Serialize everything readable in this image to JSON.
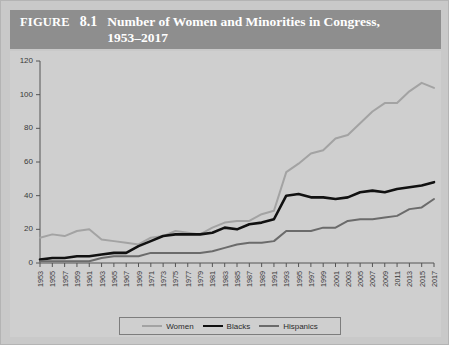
{
  "figure": {
    "label": "FIGURE",
    "number": "8.1",
    "title": "Number of Women and Minorities in Congress, 1953–2017",
    "banner_color": "#8e8e8e",
    "page_background": "#c9c9c9",
    "plot_background": "#cfcfcf"
  },
  "legend": {
    "position": "bottom-center",
    "items": [
      {
        "label": "Women",
        "color": "#a3a3a3",
        "width": 2.0
      },
      {
        "label": "Blacks",
        "color": "#111111",
        "width": 2.6
      },
      {
        "label": "Hispanics",
        "color": "#6b6b6b",
        "width": 2.0
      }
    ]
  },
  "chart_data": {
    "type": "line",
    "title": "Number of Women and Minorities in Congress, 1953–2017",
    "xlabel": "",
    "ylabel": "",
    "grid": false,
    "legend_position": "bottom-center",
    "xlim": [
      1953,
      2017
    ],
    "ylim": [
      0,
      120
    ],
    "ytick_values": [
      0,
      20,
      40,
      60,
      80,
      100,
      120
    ],
    "ytick_labels": [
      "0",
      "20",
      "40",
      "60",
      "80",
      "100",
      "120"
    ],
    "x": [
      1953,
      1955,
      1957,
      1959,
      1961,
      1963,
      1965,
      1967,
      1969,
      1971,
      1973,
      1975,
      1977,
      1979,
      1981,
      1983,
      1985,
      1987,
      1989,
      1991,
      1993,
      1995,
      1997,
      1999,
      2001,
      2003,
      2005,
      2007,
      2009,
      2011,
      2013,
      2015,
      2017
    ],
    "categories": [
      "1953",
      "1955",
      "1957",
      "1959",
      "1961",
      "1963",
      "1965",
      "1967",
      "1969",
      "1971",
      "1973",
      "1975",
      "1977",
      "1979",
      "1981",
      "1983",
      "1985",
      "1987",
      "1989",
      "1991",
      "1993",
      "1995",
      "1997",
      "1999",
      "2001",
      "2003",
      "2005",
      "2007",
      "2009",
      "2011",
      "2013",
      "2015",
      "2017"
    ],
    "series": [
      {
        "name": "Women",
        "color": "#a3a3a3",
        "values": [
          15,
          17,
          16,
          19,
          20,
          14,
          13,
          12,
          11,
          15,
          16,
          19,
          18,
          17,
          21,
          24,
          25,
          25,
          29,
          31,
          54,
          59,
          65,
          67,
          74,
          76,
          83,
          90,
          95,
          95,
          102,
          107,
          104
        ]
      },
      {
        "name": "Blacks",
        "color": "#111111",
        "values": [
          2,
          3,
          3,
          4,
          4,
          5,
          6,
          6,
          10,
          13,
          16,
          17,
          17,
          17,
          18,
          21,
          20,
          23,
          24,
          26,
          40,
          41,
          39,
          39,
          38,
          39,
          42,
          43,
          42,
          44,
          45,
          46,
          48
        ]
      },
      {
        "name": "Hispanics",
        "color": "#6b6b6b",
        "values": [
          1,
          1,
          1,
          1,
          1,
          3,
          4,
          4,
          4,
          6,
          6,
          6,
          6,
          6,
          7,
          9,
          11,
          12,
          12,
          13,
          19,
          19,
          19,
          21,
          21,
          25,
          26,
          26,
          27,
          28,
          32,
          33,
          38
        ]
      }
    ]
  }
}
